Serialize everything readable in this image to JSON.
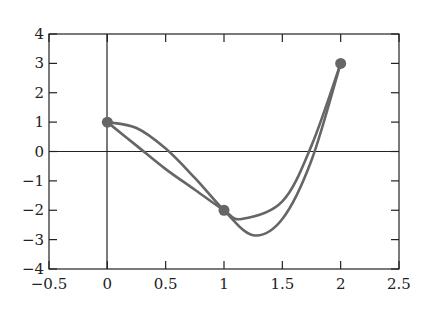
{
  "chart_data": {
    "type": "line",
    "title": "",
    "xlabel": "",
    "ylabel": "",
    "xlim": [
      -0.5,
      2.5
    ],
    "ylim": [
      -4,
      4
    ],
    "grid": false,
    "x_ticks": [
      "−0.5",
      "0",
      "0.5",
      "1",
      "1.5",
      "2",
      "2.5"
    ],
    "y_ticks": [
      "4",
      "3",
      "2",
      "1",
      "0",
      "−1",
      "−2",
      "−3",
      "−4"
    ],
    "points": [
      {
        "x": 0,
        "y": 1
      },
      {
        "x": 1,
        "y": -2
      },
      {
        "x": 2,
        "y": 3
      }
    ],
    "series": [
      {
        "name": "curve-1",
        "x": [
          0,
          0.25,
          0.5,
          0.75,
          1,
          1.25,
          1.5,
          1.75,
          2
        ],
        "y": [
          1,
          0.8,
          0.1,
          -0.9,
          -2,
          -2.85,
          -2.3,
          -0.3,
          3
        ]
      },
      {
        "name": "curve-2",
        "x": [
          0,
          0.25,
          0.5,
          0.75,
          1,
          1.15,
          1.5,
          1.75,
          2
        ],
        "y": [
          1,
          0.2,
          -0.6,
          -1.3,
          -2,
          -2.3,
          -1.7,
          0.2,
          3
        ]
      }
    ],
    "color": "#666666"
  }
}
